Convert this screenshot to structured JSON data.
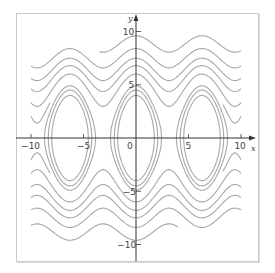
{
  "chart_data": {
    "type": "line",
    "title": "",
    "xlabel": "x",
    "ylabel": "y",
    "xlim": [
      -11,
      11
    ],
    "ylim": [
      -12,
      12
    ],
    "x_ticks": [
      -10,
      -5,
      0,
      5,
      10
    ],
    "x_tick_labels": [
      "-10",
      "-5",
      "0",
      "5",
      "10"
    ],
    "y_ticks": [
      -10,
      -5,
      5,
      10
    ],
    "y_tick_labels": [
      "-10",
      "-5",
      "5",
      "10"
    ],
    "grid": false,
    "legend": null,
    "model": {
      "energy": "y^2/2 + k(1 - cos x)",
      "k": 6.8
    },
    "centers_x": [
      -6.283,
      0,
      6.283
    ],
    "closed_orbit_levels_ymax": [
      4.0,
      4.5,
      4.9
    ],
    "rotating_curve_levels_y_at_0": [
      9.6,
      8.4,
      7.5,
      6.8,
      6.0
    ],
    "rotating_curve_levels_y_at_0_lower": [
      -9.6,
      -8.4,
      -7.5,
      -6.8,
      -6.0
    ],
    "line_color": "#a8a8a8",
    "axis_color": "#333333"
  },
  "axes": {
    "x_label": "x",
    "y_label": "y",
    "origin_label": "0"
  }
}
